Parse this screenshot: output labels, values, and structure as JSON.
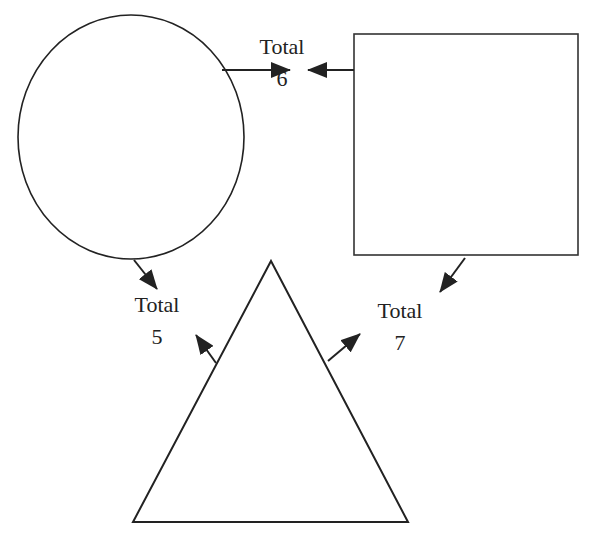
{
  "diagram": {
    "shapes": [
      {
        "id": "circle",
        "type": "circle"
      },
      {
        "id": "square",
        "type": "square"
      },
      {
        "id": "triangle",
        "type": "triangle"
      }
    ],
    "labels": {
      "top": {
        "title": "Total",
        "value": "6"
      },
      "left": {
        "title": "Total",
        "value": "5"
      },
      "right": {
        "title": "Total",
        "value": "7"
      }
    },
    "connections": [
      {
        "from": "circle",
        "to": "top"
      },
      {
        "from": "square",
        "to": "top"
      },
      {
        "from": "circle",
        "to": "left"
      },
      {
        "from": "triangle",
        "to": "left"
      },
      {
        "from": "square",
        "to": "right"
      },
      {
        "from": "triangle",
        "to": "right"
      }
    ],
    "colors": {
      "stroke": "#222222",
      "background": "#ffffff"
    }
  }
}
